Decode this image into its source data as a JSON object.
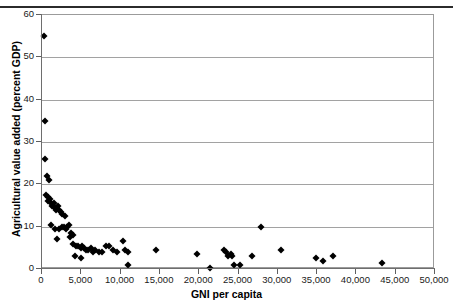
{
  "caption": {
    "text": "",
    "visible_fragment": ""
  },
  "chart_data": {
    "type": "scatter",
    "title": "",
    "xlabel": "GNI per capita",
    "ylabel": "Agricultural value added (percent GDP)",
    "xlim": [
      0,
      50000
    ],
    "ylim": [
      0,
      60
    ],
    "xticks": [
      0,
      5000,
      10000,
      15000,
      20000,
      25000,
      30000,
      35000,
      40000,
      45000,
      50000
    ],
    "xtick_labels": [
      "0",
      "5,000",
      "10,000",
      "15,000",
      "20,000",
      "25,000",
      "30,000",
      "35,000",
      "40,000",
      "45,000",
      "50,000"
    ],
    "yticks": [
      0,
      10,
      20,
      30,
      40,
      50,
      60
    ],
    "ytick_labels": [
      "0",
      "10",
      "20",
      "30",
      "40",
      "50",
      "60"
    ],
    "grid": "horizontal",
    "legend": "none",
    "marker": "diamond",
    "marker_color": "#000000",
    "series": [
      {
        "name": "Countries",
        "points": [
          [
            300,
            55.0
          ],
          [
            400,
            35.0
          ],
          [
            350,
            26.0
          ],
          [
            600,
            22.0
          ],
          [
            900,
            21.0
          ],
          [
            500,
            17.5
          ],
          [
            700,
            17.0
          ],
          [
            800,
            16.0
          ],
          [
            1000,
            16.5
          ],
          [
            1100,
            15.5
          ],
          [
            1300,
            15.0
          ],
          [
            1500,
            15.5
          ],
          [
            1600,
            14.5
          ],
          [
            1800,
            14.0
          ],
          [
            2000,
            15.0
          ],
          [
            2200,
            14.0
          ],
          [
            2400,
            13.5
          ],
          [
            2600,
            13.0
          ],
          [
            2900,
            12.5
          ],
          [
            1200,
            10.5
          ],
          [
            1700,
            9.5
          ],
          [
            2100,
            9.5
          ],
          [
            2500,
            10.0
          ],
          [
            2800,
            10.0
          ],
          [
            3000,
            9.5
          ],
          [
            3200,
            10.0
          ],
          [
            1900,
            7.0
          ],
          [
            3400,
            10.5
          ],
          [
            3700,
            8.5
          ],
          [
            4000,
            6.0
          ],
          [
            4300,
            5.5
          ],
          [
            4600,
            5.5
          ],
          [
            4900,
            5.0
          ],
          [
            5100,
            5.5
          ],
          [
            5400,
            5.0
          ],
          [
            5600,
            4.5
          ],
          [
            5900,
            4.5
          ],
          [
            6200,
            5.0
          ],
          [
            6500,
            4.0
          ],
          [
            6800,
            4.5
          ],
          [
            7200,
            4.0
          ],
          [
            7600,
            4.0
          ],
          [
            4200,
            3.0
          ],
          [
            5000,
            2.5
          ],
          [
            3500,
            7.5
          ],
          [
            3900,
            8.0
          ],
          [
            8200,
            5.5
          ],
          [
            8500,
            5.5
          ],
          [
            9000,
            4.5
          ],
          [
            9600,
            4.0
          ],
          [
            10300,
            6.5
          ],
          [
            10600,
            4.5
          ],
          [
            10900,
            4.0
          ],
          [
            11000,
            1.0
          ],
          [
            14500,
            4.5
          ],
          [
            19700,
            3.5
          ],
          [
            21400,
            0.3
          ],
          [
            23100,
            4.5
          ],
          [
            23400,
            4.0
          ],
          [
            23700,
            3.0
          ],
          [
            24000,
            3.5
          ],
          [
            24200,
            3.0
          ],
          [
            24400,
            1.0
          ],
          [
            25200,
            1.0
          ],
          [
            26700,
            3.0
          ],
          [
            27900,
            10.0
          ],
          [
            30400,
            4.5
          ],
          [
            34800,
            2.5
          ],
          [
            35700,
            1.8
          ],
          [
            37000,
            3.0
          ],
          [
            43200,
            1.5
          ]
        ]
      }
    ]
  },
  "axes_geometry": {
    "plot_left_px": 41,
    "plot_right_px": 434,
    "plot_top_px": 14,
    "plot_bottom_px": 268
  }
}
